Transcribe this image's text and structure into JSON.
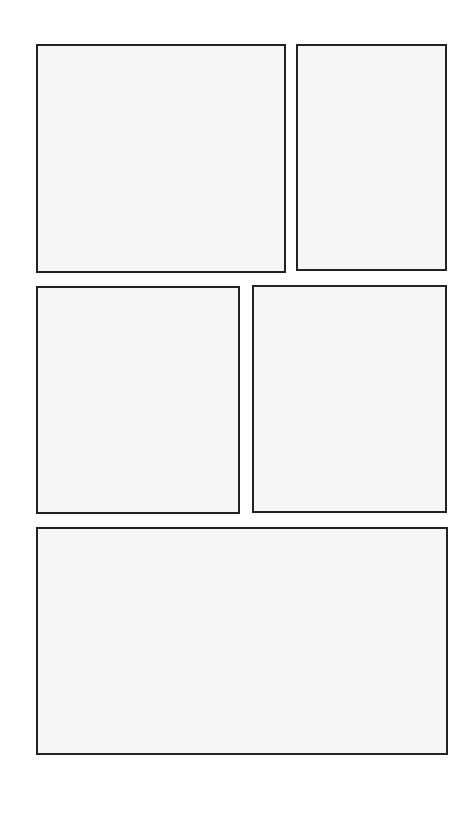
{
  "page": {
    "type": "comic-page-layout",
    "background": "#ffffff",
    "border_color": "#222222",
    "panel_fill": "#f6f6f6"
  },
  "panels": [
    {
      "id": "panel-1",
      "row": 1,
      "x": 36,
      "y": 44,
      "w": 250,
      "h": 229
    },
    {
      "id": "panel-2",
      "row": 1,
      "x": 296,
      "y": 44,
      "w": 151,
      "h": 227
    },
    {
      "id": "panel-3",
      "row": 2,
      "x": 36,
      "y": 286,
      "w": 204,
      "h": 228
    },
    {
      "id": "panel-4",
      "row": 2,
      "x": 252,
      "y": 285,
      "w": 195,
      "h": 228
    },
    {
      "id": "panel-5",
      "row": 3,
      "x": 36,
      "y": 527,
      "w": 412,
      "h": 228
    }
  ]
}
